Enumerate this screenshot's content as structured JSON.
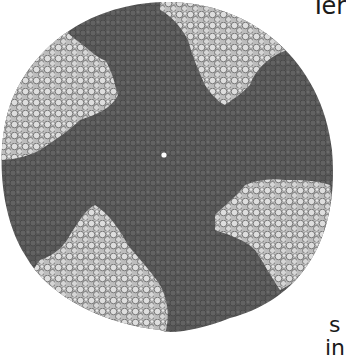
{
  "figure": {
    "colors": {
      "background": "#ffffff",
      "dark_subunits": "#5a5a5a",
      "dark_subunits_shade": "#444444",
      "light_subunits": "#d4d4d4",
      "light_outline": "#6a6a6a",
      "center_marker": "#ffffff"
    },
    "center_marker_label": "central axis dot"
  },
  "text_fragments": {
    "top_right": "Ter",
    "bottom_right_line1": "s",
    "bottom_right_line2": "in"
  }
}
